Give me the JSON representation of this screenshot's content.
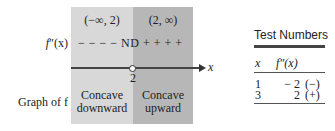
{
  "sign_chart": {
    "intervals": [
      {
        "label": "(−∞, 2)",
        "shade": "#d8d8d8"
      },
      {
        "label": "(2, ∞)",
        "shade": "#b7b7b7"
      }
    ],
    "row_labels": {
      "second_derivative_prefix": "f",
      "second_derivative_primes": "″",
      "second_derivative_suffix": "(x)",
      "graph": "Graph of f"
    },
    "signs": "− − − − ND + + + +",
    "axis": {
      "variable": "x",
      "critical_value": "2",
      "critical_point_marker": "open-circle"
    },
    "concavity": [
      {
        "line1": "Concave",
        "line2": "downward"
      },
      {
        "line1": "Concave",
        "line2": "upward"
      }
    ]
  },
  "test_numbers": {
    "title": "Test Numbers",
    "headers": [
      "x",
      "f″(x)"
    ],
    "rows": [
      {
        "x": "1",
        "value": "− 2",
        "sign": "(−)"
      },
      {
        "x": "3",
        "value": "2",
        "sign": "(+)"
      }
    ]
  }
}
